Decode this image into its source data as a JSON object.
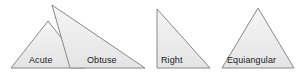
{
  "figure": {
    "background_color": "#ffffff",
    "stroke_color": "#888888",
    "fill_color_top": "#f4f4f4",
    "fill_color_bottom": "#e6e6e6",
    "label_color": "#1a1a1a",
    "width": 298,
    "height": 74
  },
  "shapes": [
    {
      "id": "acute",
      "label": "Acute",
      "points": "11,68 48,21 85,68",
      "label_left": 29,
      "label_top": 55
    },
    {
      "id": "obtuse",
      "label": "Obtuse",
      "points": "70,68 52,5 145,68",
      "label_left": 87,
      "label_top": 55
    },
    {
      "id": "right",
      "label": "Right",
      "points": "157,9 157,68 210,68",
      "label_left": 161,
      "label_top": 55
    },
    {
      "id": "equiangular",
      "label": "Equiangular",
      "points": "258,8 222,68 294,68",
      "label_left": 227,
      "label_top": 55
    }
  ]
}
